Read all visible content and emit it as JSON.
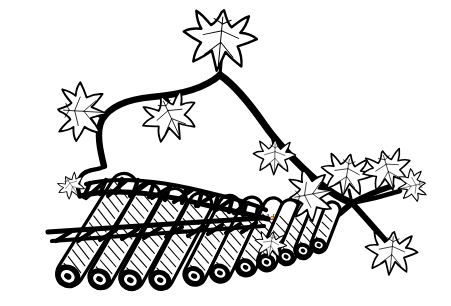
{
  "artwork": {
    "title": "Pan Flute with Ivy Vine",
    "subject": "pan-flute",
    "style": "black and white line art illustration",
    "background_color": "#ffffff",
    "ink_color": "#000000",
    "width": 451,
    "height": 306,
    "signature": "Adi"
  },
  "instrument": {
    "name": "pan-flute",
    "pipe_count": 11,
    "binding_name": "woven cord lashing",
    "binding_rows": 2,
    "orientation": "descending left to right, longest pipe at left",
    "pipes": [
      {
        "index": 1,
        "label": "pipe-1",
        "length_rank": "longest"
      },
      {
        "index": 2,
        "label": "pipe-2",
        "length_rank": "long"
      },
      {
        "index": 3,
        "label": "pipe-3",
        "length_rank": "long"
      },
      {
        "index": 4,
        "label": "pipe-4",
        "length_rank": "medium"
      },
      {
        "index": 5,
        "label": "pipe-5",
        "length_rank": "medium"
      },
      {
        "index": 6,
        "label": "pipe-6",
        "length_rank": "medium"
      },
      {
        "index": 7,
        "label": "pipe-7",
        "length_rank": "short"
      },
      {
        "index": 8,
        "label": "pipe-8",
        "length_rank": "short"
      },
      {
        "index": 9,
        "label": "pipe-9",
        "length_rank": "short"
      },
      {
        "index": 10,
        "label": "pipe-10",
        "length_rank": "shortest"
      },
      {
        "index": 11,
        "label": "pipe-11",
        "length_rank": "shortest"
      }
    ]
  },
  "vine": {
    "name": "ivy-vine",
    "leaf_count": 10,
    "leaves": [
      {
        "id": "leaf-top-center",
        "position": "top center crown",
        "size": "large"
      },
      {
        "id": "leaf-upper-left",
        "position": "upper left arch",
        "size": "medium"
      },
      {
        "id": "leaf-upper-mid",
        "position": "upper middle arch",
        "size": "medium"
      },
      {
        "id": "leaf-mid-right",
        "position": "right descending stem",
        "size": "small"
      },
      {
        "id": "leaf-junction-left",
        "position": "left of right junction",
        "size": "medium"
      },
      {
        "id": "leaf-junction-up",
        "position": "above right junction",
        "size": "medium"
      },
      {
        "id": "leaf-far-right-up",
        "position": "far right upper branch",
        "size": "medium"
      },
      {
        "id": "leaf-far-right-tip",
        "position": "far right branch tip",
        "size": "small"
      },
      {
        "id": "leaf-bottom-right",
        "position": "lower right branch",
        "size": "medium"
      },
      {
        "id": "leaf-near-flute",
        "position": "near flute right end",
        "size": "small"
      },
      {
        "id": "leaf-flute-left",
        "position": "above flute left end",
        "size": "small"
      }
    ]
  }
}
